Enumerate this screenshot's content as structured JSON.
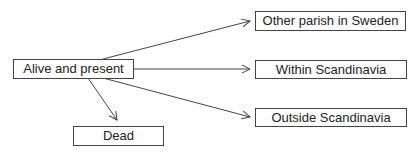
{
  "diagram": {
    "nodes": [
      {
        "id": "alive",
        "label": "Alive and present"
      },
      {
        "id": "dead",
        "label": "Dead"
      },
      {
        "id": "other_parish",
        "label": "Other parish in Sweden"
      },
      {
        "id": "within",
        "label": "Within Scandinavia"
      },
      {
        "id": "outside",
        "label": "Outside Scandinavia"
      }
    ],
    "edges": [
      {
        "from": "alive",
        "to": "other_parish"
      },
      {
        "from": "alive",
        "to": "within"
      },
      {
        "from": "alive",
        "to": "outside"
      },
      {
        "from": "alive",
        "to": "dead"
      }
    ],
    "colors": {
      "stroke": "#444444",
      "text": "#222222"
    }
  }
}
